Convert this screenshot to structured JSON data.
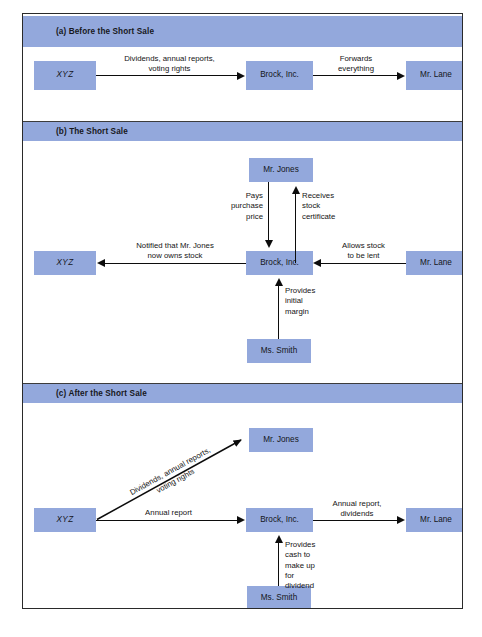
{
  "figure": {
    "sections": [
      {
        "id": "a",
        "title": "(a) Before the Short Sale",
        "boxes": [
          {
            "name": "xyz",
            "label": "XYZ"
          },
          {
            "name": "brock",
            "label": "Brock, Inc."
          },
          {
            "name": "lane",
            "label": "Mr. Lane"
          }
        ],
        "arrow_labels": [
          {
            "name": "dividends-annual-reports-voting-rights",
            "text": "Dividends, annual reports,\nvoting rights"
          },
          {
            "name": "forwards-everything",
            "text": "Forwards\neverything"
          }
        ]
      },
      {
        "id": "b",
        "title": "(b) The Short Sale",
        "boxes": [
          {
            "name": "jones",
            "label": "Mr. Jones"
          },
          {
            "name": "xyz",
            "label": "XYZ"
          },
          {
            "name": "brock",
            "label": "Brock, Inc."
          },
          {
            "name": "lane",
            "label": "Mr. Lane"
          },
          {
            "name": "smith",
            "label": "Ms. Smith"
          }
        ],
        "arrow_labels": [
          {
            "name": "pays-purchase-price",
            "text": "Pays\npurchase\nprice"
          },
          {
            "name": "receives-stock-certificate",
            "text": "Receives\nstock\ncertificate"
          },
          {
            "name": "notified-that-mr-jones-now-owns-stock",
            "text": "Notified that Mr. Jones\nnow owns stock"
          },
          {
            "name": "allows-stock-to-be-lent",
            "text": "Allows stock\nto be lent"
          },
          {
            "name": "provides-initial-margin",
            "text": "Provides\ninitial\nmargin"
          }
        ]
      },
      {
        "id": "c",
        "title": "(c) After the Short Sale",
        "boxes": [
          {
            "name": "jones",
            "label": "Mr. Jones"
          },
          {
            "name": "xyz",
            "label": "XYZ"
          },
          {
            "name": "brock",
            "label": "Brock, Inc."
          },
          {
            "name": "lane",
            "label": "Mr. Lane"
          },
          {
            "name": "smith",
            "label": "Ms. Smith"
          }
        ],
        "arrow_labels": [
          {
            "name": "dividends-annual-reports-voting-rights",
            "text": "Dividends, annual reports,\nvoting rights"
          },
          {
            "name": "annual-report",
            "text": "Annual report"
          },
          {
            "name": "annual-report-dividends",
            "text": "Annual report,\ndividends"
          },
          {
            "name": "provides-cash-to-make-up-for-dividend",
            "text": "Provides\ncash to\nmake up\nfor\ndividend"
          }
        ]
      }
    ]
  },
  "colors": {
    "box_fill": "#93a8dc",
    "bar_fill": "#93a8dc",
    "frame_border": "#2a2a2a",
    "arrow": "#0c0c0c",
    "background": "#ffffff"
  }
}
